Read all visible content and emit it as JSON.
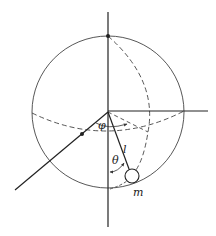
{
  "diagram": {
    "colors": {
      "line": "#333333",
      "background": "#ffffff"
    },
    "sphere": {
      "cx": 108,
      "cy": 112,
      "r": 76
    },
    "labels": {
      "phi": "φ",
      "theta": "θ",
      "length": "l",
      "mass": "m"
    }
  }
}
